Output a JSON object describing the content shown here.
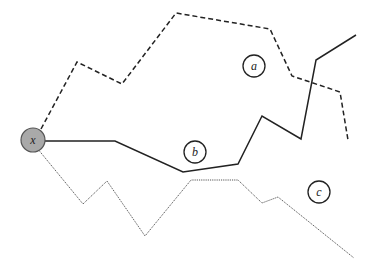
{
  "diagram": {
    "type": "path-diagram",
    "width": 374,
    "height": 273,
    "background": "#ffffff",
    "start_node": {
      "label": "x",
      "cx": 33,
      "cy": 140,
      "r": 12,
      "fill": "#a9a9a9",
      "stroke": "#555555"
    },
    "regions": [
      {
        "label": "a",
        "cx": 254,
        "cy": 66,
        "r": 11
      },
      {
        "label": "b",
        "cx": 195,
        "cy": 152,
        "r": 11
      },
      {
        "label": "c",
        "cx": 319,
        "cy": 192,
        "r": 11
      }
    ],
    "paths": [
      {
        "name": "dashed-path",
        "style": "dashed",
        "stroke": "#222222",
        "width": 1.5,
        "dash": "5,3",
        "points": "41,129 77,62 122,84 176,13 270,29 292,76 340,92 348,140"
      },
      {
        "name": "solid-path",
        "style": "solid",
        "stroke": "#222222",
        "width": 1.5,
        "dash": "",
        "points": "45,141 115,141 183,172 238,164 262,116 301,139 316,60 356,35"
      },
      {
        "name": "dotted-path",
        "style": "dotted",
        "stroke": "#555555",
        "width": 1,
        "dash": "1.2,1",
        "points": "37,148 83,204 107,181 145,236 191,180 238,180 262,203 278,197 354,258"
      }
    ]
  }
}
